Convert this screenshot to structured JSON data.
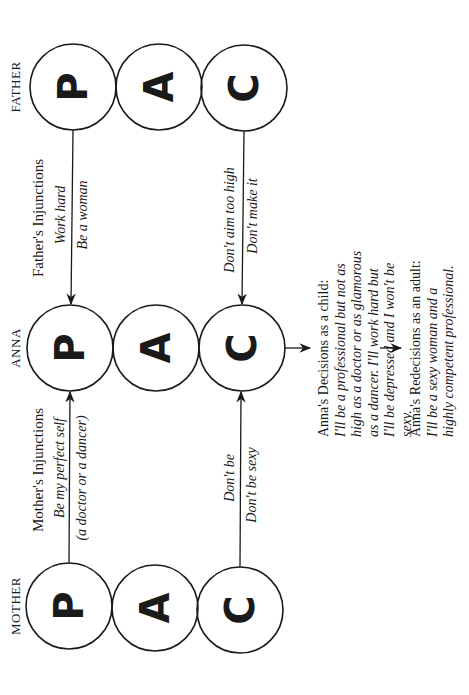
{
  "columns": {
    "father": {
      "label": "FATHER",
      "circles": [
        "P",
        "A",
        "C"
      ]
    },
    "anna": {
      "label": "ANNA",
      "circles": [
        "P",
        "A",
        "C"
      ]
    },
    "mother": {
      "label": "MOTHER",
      "circles": [
        "P",
        "A",
        "C"
      ]
    }
  },
  "father_injunctions": {
    "heading": "Father's Injunctions",
    "parent_messages": [
      "Work hard",
      "Be a woman"
    ],
    "child_messages": [
      "Don't aim too high",
      "Don't make it"
    ]
  },
  "mother_injunctions": {
    "heading": "Mother's Injunctions",
    "parent_messages": [
      "Be my perfect self",
      "(a doctor or a dancer)"
    ],
    "child_messages": [
      "Don't be",
      "Don't be sexy"
    ]
  },
  "decisions": {
    "title": "Anna's Decisions as a child:",
    "lines": [
      "I'll be a professional but not as",
      "high as a doctor or as glamorous",
      "as a dancer. I'll work hard but",
      "I'll be depressed and I won't be",
      "sexy."
    ]
  },
  "redecisions": {
    "title": "Anna's Redecisions as an adult:",
    "lines": [
      "I'll be a sexy woman and a",
      "highly competent professional."
    ]
  },
  "colors": {
    "ink": "#1a1a1a",
    "background": "#ffffff"
  }
}
